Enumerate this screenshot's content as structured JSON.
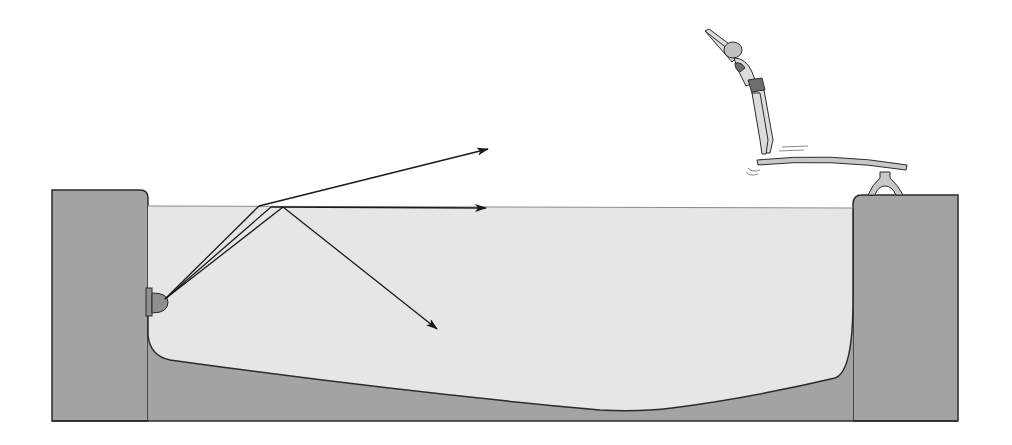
{
  "figure": {
    "colors": {
      "background": "#ffffff",
      "wall": "#a3a3a3",
      "water": "#e6e6e6",
      "outline": "#2b2b2b",
      "ray": "#1a1a1a",
      "light_fixture": "#8f8f8f",
      "board": "#c8c8c8",
      "skin": "#dcdcdc",
      "swimsuit": "#6e6e6e"
    },
    "elements": {
      "left_wall": "pool-wall-left",
      "right_wall": "pool-wall-right",
      "water": "pool-water",
      "light": "underwater-light",
      "rays": [
        {
          "name": "refracted-ray",
          "direction": "out of water, bent upward"
        },
        {
          "name": "critical-angle-ray",
          "direction": "along the surface"
        },
        {
          "name": "reflected-ray",
          "direction": "totally internally reflected downward"
        }
      ],
      "diving_board": "diving-board",
      "diver": "diver"
    }
  }
}
